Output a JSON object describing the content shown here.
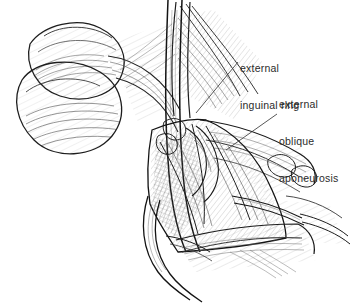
{
  "figure": {
    "kind": "anatomical-line-illustration",
    "technique": "pen-and-ink hatching",
    "background_color": "#ffffff",
    "ink_color": "#1d1d1d",
    "label_color": "#2b2b2b"
  },
  "annotations": [
    {
      "id": "external-inguinal-ring",
      "lines": [
        "external",
        "inguinal ring"
      ],
      "leader": {
        "x1": 238.0,
        "y1": 62.0,
        "x2": 196.0,
        "y2": 113.0
      }
    },
    {
      "id": "external-oblique-aponeurosis",
      "lines": [
        "external",
        "oblique",
        "aponeurosis"
      ],
      "leader": {
        "x1": 277.0,
        "y1": 114.0,
        "x2": 226.0,
        "y2": 150.0
      }
    }
  ]
}
